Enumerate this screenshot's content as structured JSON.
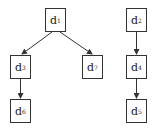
{
  "diagram": {
    "type": "directed-graph",
    "nodes": [
      {
        "id": "d1",
        "letter": "d",
        "sub": "1",
        "x": 45,
        "y": 8
      },
      {
        "id": "d2",
        "letter": "d",
        "sub": "2",
        "x": 126,
        "y": 8
      },
      {
        "id": "d3",
        "letter": "d",
        "sub": "3",
        "x": 10,
        "y": 55
      },
      {
        "id": "d7",
        "letter": "d",
        "sub": "7",
        "x": 82,
        "y": 55
      },
      {
        "id": "d4",
        "letter": "d",
        "sub": "4",
        "x": 126,
        "y": 55
      },
      {
        "id": "d6",
        "letter": "d",
        "sub": "6",
        "x": 10,
        "y": 99
      },
      {
        "id": "d5",
        "letter": "d",
        "sub": "5",
        "x": 126,
        "y": 99
      }
    ],
    "edges": [
      {
        "from": "d1",
        "to": "d3"
      },
      {
        "from": "d1",
        "to": "d7"
      },
      {
        "from": "d3",
        "to": "d6"
      },
      {
        "from": "d2",
        "to": "d4"
      },
      {
        "from": "d4",
        "to": "d5"
      }
    ],
    "colors": {
      "stroke": "#333333",
      "text": "#222222",
      "background": "#ffffff"
    }
  }
}
